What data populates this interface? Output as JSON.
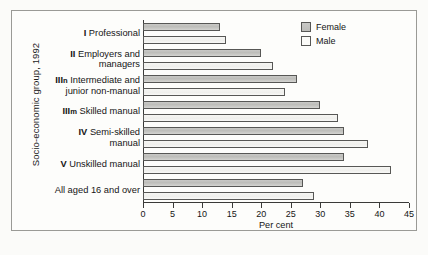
{
  "figure": {
    "y_axis_title": "Socio-economic group, 1992",
    "x_axis_title": "Per cent"
  },
  "legend": {
    "position": "top-right",
    "entries": [
      {
        "label": "Female",
        "swatch": "female-swatch",
        "color": "#c3c3c0"
      },
      {
        "label": "Male",
        "swatch": "male-swatch",
        "color": "#fbfbf8"
      }
    ]
  },
  "chart_data": {
    "type": "bar",
    "orientation": "horizontal",
    "title": "",
    "subtitle": "",
    "xlabel": "Per cent",
    "ylabel": "Socio-economic group, 1992",
    "xlim": [
      0,
      45
    ],
    "xticks": [
      0,
      5,
      10,
      15,
      20,
      25,
      30,
      35,
      40,
      45
    ],
    "xtick_labels": [
      "0",
      "5",
      "10",
      "15",
      "20",
      "25",
      "30",
      "35",
      "40",
      "45"
    ],
    "grid": false,
    "legend_position": "top-right",
    "categories": [
      "I Professional",
      "II Employers and managers",
      "IIIn Intermediate and junior non-manual",
      "IIIm Skilled manual",
      "IV Semi-skilled manual",
      "V Unskilled manual",
      "All aged 16 and over"
    ],
    "category_lines": [
      [
        "I Professional"
      ],
      [
        "II Employers and",
        "managers"
      ],
      [
        "IIIn Intermediate and",
        "junior non-manual"
      ],
      [
        "IIIm Skilled manual"
      ],
      [
        "IV Semi-skilled",
        "manual"
      ],
      [
        "V Unskilled manual"
      ],
      [
        "All aged 16 and over"
      ]
    ],
    "series": [
      {
        "name": "Female",
        "values": [
          13,
          20,
          26,
          30,
          34,
          34,
          27
        ]
      },
      {
        "name": "Male",
        "values": [
          14,
          22,
          24,
          33,
          38,
          42,
          29
        ]
      }
    ]
  }
}
